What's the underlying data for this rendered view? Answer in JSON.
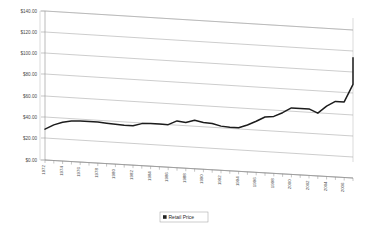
{
  "chart_data": {
    "type": "line",
    "title": "",
    "subtitle": "",
    "xlabel": "",
    "ylabel": "",
    "ylim": [
      0,
      140
    ],
    "grid": true,
    "legend_position": "bottom",
    "style": "3d-perspective-line",
    "y_ticks": [
      "$0.00",
      "$20.00",
      "$40.00",
      "$60.00",
      "$80.00",
      "$100.00",
      "$120.00",
      "$140.00"
    ],
    "y_tick_values": [
      0,
      20,
      40,
      60,
      80,
      100,
      120,
      140
    ],
    "x_tick_labels": [
      "1972",
      "1974",
      "1976",
      "1978",
      "1980",
      "1982",
      "1984",
      "1986",
      "1988",
      "1990",
      "1992",
      "1994",
      "1996",
      "1998",
      "2000",
      "2002",
      "2004",
      "2006"
    ],
    "categories": [
      "1972",
      "1973",
      "1974",
      "1975",
      "1976",
      "1977",
      "1978",
      "1979",
      "1980",
      "1981",
      "1982",
      "1983",
      "1984",
      "1985",
      "1986",
      "1987",
      "1988",
      "1989",
      "1990",
      "1991",
      "1992",
      "1993",
      "1994",
      "1995",
      "1996",
      "1997",
      "1998",
      "1999",
      "2000",
      "2001",
      "2002",
      "2003",
      "2004",
      "2005",
      "2006",
      "2007"
    ],
    "series": [
      {
        "name": "Retail Price",
        "color": "#1c1c1c",
        "values": [
          29.0,
          33.5,
          36.5,
          38.0,
          38.5,
          38.5,
          38.5,
          38.0,
          37.5,
          37.0,
          37.0,
          39.5,
          40.0,
          40.0,
          40.0,
          44.0,
          43.0,
          45.5,
          44.0,
          43.5,
          41.5,
          41.0,
          41.0,
          44.0,
          48.0,
          52.5,
          53.5,
          57.5,
          62.5,
          62.5,
          62.5,
          59.0,
          66.0,
          71.0,
          71.0,
          88.0
        ]
      }
    ],
    "final_plateau_value": 113.0
  },
  "legend": {
    "entries": [
      {
        "label": "Retail Price",
        "swatch_color": "#222222"
      }
    ]
  },
  "axis": {
    "y_axis_name": "price-axis",
    "x_axis_name": "year-axis"
  }
}
